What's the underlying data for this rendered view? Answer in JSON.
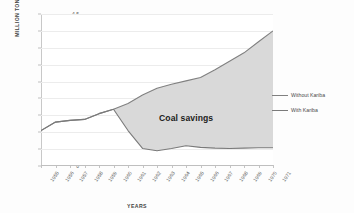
{
  "chart_data": {
    "type": "area",
    "title": "",
    "xlabel": "YEARS",
    "ylabel": "MILLION TONS",
    "ylim": [
      0,
      4.5
    ],
    "ytick_step": 0.5,
    "yticks": [
      "0",
      "0.5",
      "1",
      "1.5",
      "2",
      "2.5",
      "3",
      "3.5",
      "4",
      "4.5"
    ],
    "ytick_values": [
      0,
      0.5,
      1,
      1.5,
      2,
      2.5,
      3,
      3.5,
      4,
      4.5
    ],
    "grid": true,
    "legend_position": "right",
    "categories": [
      "1955",
      "1956",
      "1957",
      "1958",
      "1959",
      "1960",
      "1961",
      "1962",
      "1963",
      "1964",
      "1965",
      "1966",
      "1967",
      "1968",
      "1969",
      "1970",
      "1971"
    ],
    "series": [
      {
        "name": "Without Kariba",
        "color": "#808080",
        "values": [
          1.05,
          1.3,
          1.35,
          1.38,
          1.55,
          1.68,
          1.85,
          2.1,
          2.3,
          2.42,
          2.52,
          2.62,
          2.85,
          3.1,
          3.35,
          3.68,
          4.0
        ]
      },
      {
        "name": "With Kariba",
        "color": "#7a7a7a",
        "values": [
          1.05,
          1.3,
          1.35,
          1.38,
          1.55,
          1.68,
          1.05,
          0.52,
          0.45,
          0.52,
          0.6,
          0.55,
          0.53,
          0.52,
          0.53,
          0.54,
          0.54
        ]
      }
    ],
    "fill_between": {
      "label": "Coal savings",
      "color": "#d9d9d9",
      "from_series": "With Kariba",
      "to_series": "Without Kariba"
    },
    "annotations": [
      {
        "text": "Coal savings",
        "x": "1965",
        "y": 1.6
      }
    ]
  },
  "legend": {
    "items": [
      {
        "label": "Without Kariba"
      },
      {
        "label": "With Kariba"
      }
    ]
  },
  "axes": {
    "x_title": "YEARS",
    "y_title": "MILLION TONS"
  }
}
